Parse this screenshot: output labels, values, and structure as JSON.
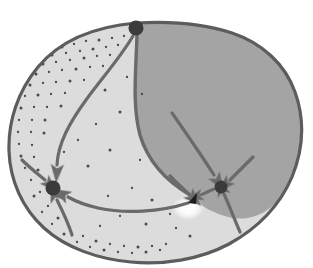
{
  "figure": {
    "title": "Phase portrait on a closed surface region",
    "type": "hand-drawn-diagram",
    "background_color": "#ffffff",
    "width": 313,
    "height": 268
  },
  "palette": {
    "outline": "#5c5c5c",
    "outline_dark": "#4a4a4a",
    "light_region_fill": "#dcdcdc",
    "dark_region_fill": "#a4a4a4",
    "trajectory_stroke": "#6a6a6a",
    "node_fill": "#3a3a3a",
    "stipple_dot": "#4a4a4a",
    "highlight_white": "#ffffff",
    "wedge_fill": "#1e1e1e"
  },
  "outer_boundary": {
    "name": "closed-curve-boundary",
    "stroke_width": 3.2,
    "path": "M 136 23 C 170 21 205 24 232 33 C 262 43 285 64 295 92 C 305 120 303 150 292 177 C 280 205 258 228 229 244 C 199 260 163 265 131 262 C 98 259 66 248 44 228 C 22 208 10 180 9 151 C 8 121 18 91 38 67 C 58 43 90 27 136 23 Z"
  },
  "regions": [
    {
      "name": "light-basin-left",
      "label": "light region",
      "fill": "#dcdcdc",
      "has_stipple": true,
      "stipple_description": "dotted texture along inner boundary"
    },
    {
      "name": "dark-basin-right",
      "label": "dark shaded region",
      "fill": "#a4a4a4",
      "has_stipple": false
    }
  ],
  "separatrix": {
    "name": "separatrix-curve",
    "from_node": "top-node",
    "to_node": "saddle-wedge",
    "stroke_width": 3.4,
    "path": "M 137 35 C 136 70 132 105 140 135 C 148 162 168 182 190 195"
  },
  "nodes": [
    {
      "id": "top-node",
      "name": "node-top",
      "cx": 136,
      "cy": 28,
      "r": 7.5,
      "fill": "#3a3a3a",
      "kind": "source"
    },
    {
      "id": "left-node",
      "name": "node-left-sink",
      "cx": 53,
      "cy": 188,
      "r": 7.5,
      "fill": "#3a3a3a",
      "kind": "sink"
    },
    {
      "id": "right-node",
      "name": "node-right-sink",
      "cx": 221,
      "cy": 187,
      "r": 6.5,
      "fill": "#3a3a3a",
      "kind": "sink"
    }
  ],
  "saddle": {
    "name": "saddle-wedge-marker",
    "cx": 193,
    "cy": 198,
    "description": "dark wedge / arrowhead marker with specular highlight below-left"
  },
  "highlight": {
    "name": "specular-highlight",
    "cx": 188,
    "cy": 208,
    "rx": 16,
    "ry": 12,
    "color": "#ffffff"
  },
  "trajectories": [
    {
      "id": "t1",
      "name": "trajectory-top-to-left",
      "from": "top-node",
      "to": "left-node",
      "stroke_width": 3.2,
      "path": "M 133 36 C 120 58 102 78 86 100 C 70 122 58 143 57 165",
      "arrowhead": {
        "x": 57,
        "y": 170,
        "angle": 94,
        "size": 13
      }
    },
    {
      "id": "t2",
      "name": "trajectory-boundary-to-left-upper",
      "from": "outer-boundary-upper-left",
      "to": "left-node",
      "stroke_width": 3.2,
      "path": "M 22 160 C 30 168 38 174 45 180",
      "arrowhead": {
        "x": 48,
        "y": 183,
        "angle": 45,
        "size": 12
      }
    },
    {
      "id": "t3",
      "name": "trajectory-bottom-curve-to-left",
      "from": "saddle-wedge",
      "to": "left-node",
      "stroke_width": 3.2,
      "path": "M 188 203 C 160 212 125 214 98 208 C 85 205 75 201 68 197",
      "arrowhead": {
        "x": 64,
        "y": 195,
        "angle": 208,
        "size": 13
      }
    },
    {
      "id": "t4",
      "name": "trajectory-lower-boundary-to-left",
      "from": "outer-boundary-lower-left",
      "to": "left-node",
      "stroke_width": 3.2,
      "path": "M 72 235 C 68 222 62 210 57 200",
      "arrowhead": {
        "x": 55,
        "y": 196,
        "angle": 250,
        "size": 13
      }
    },
    {
      "id": "t5",
      "name": "trajectory-upper-to-right-node",
      "from": "dark-region-upper",
      "to": "right-node",
      "stroke_width": 3.2,
      "path": "M 172 113 C 186 133 200 153 214 175",
      "arrowhead": {
        "x": 217,
        "y": 180,
        "angle": 57,
        "size": 13
      }
    },
    {
      "id": "t6",
      "name": "trajectory-right-edge-to-right-node",
      "from": "dark-region-right-edge",
      "to": "right-node",
      "stroke_width": 3.2,
      "path": "M 253 157 C 245 165 238 172 230 180",
      "arrowhead": {
        "x": 227,
        "y": 183,
        "angle": 136,
        "size": 12
      }
    },
    {
      "id": "t7",
      "name": "trajectory-lower-right-to-right-node",
      "from": "dark-region-lower-right",
      "to": "right-node",
      "stroke_width": 3.2,
      "path": "M 240 232 C 234 218 229 205 224 194",
      "arrowhead": {
        "x": 222,
        "y": 190,
        "angle": 248,
        "size": 13
      }
    },
    {
      "id": "t8",
      "name": "trajectory-right-node-to-saddle",
      "from": "right-node",
      "to": "saddle-wedge",
      "stroke_width": 3.0,
      "path": "M 214 189 C 209 191 205 193 201 195",
      "arrowhead": {
        "x": 198,
        "y": 196,
        "angle": 163,
        "size": 11
      }
    },
    {
      "id": "t9",
      "name": "trajectory-separatrix-arrow-to-saddle",
      "from": "separatrix",
      "to": "saddle-wedge",
      "stroke_width": 3.2,
      "path": "M 170 176 C 177 183 183 189 189 194",
      "arrowhead": {
        "x": 192,
        "y": 197,
        "angle": 44,
        "size": 13
      }
    }
  ],
  "stipple_dots": [
    [
      62,
      47
    ],
    [
      74,
      44
    ],
    [
      86,
      41
    ],
    [
      99,
      40
    ],
    [
      112,
      38
    ],
    [
      124,
      36
    ],
    [
      52,
      55
    ],
    [
      66,
      53
    ],
    [
      80,
      51
    ],
    [
      93,
      49
    ],
    [
      106,
      47
    ],
    [
      118,
      45
    ],
    [
      43,
      64
    ],
    [
      56,
      62
    ],
    [
      70,
      60
    ],
    [
      84,
      58
    ],
    [
      97,
      56
    ],
    [
      110,
      55
    ],
    [
      36,
      74
    ],
    [
      49,
      72
    ],
    [
      62,
      70
    ],
    [
      76,
      69
    ],
    [
      90,
      67
    ],
    [
      103,
      66
    ],
    [
      30,
      85
    ],
    [
      43,
      83
    ],
    [
      56,
      82
    ],
    [
      70,
      81
    ],
    [
      84,
      80
    ],
    [
      25,
      96
    ],
    [
      38,
      95
    ],
    [
      51,
      94
    ],
    [
      65,
      93
    ],
    [
      21,
      108
    ],
    [
      34,
      107
    ],
    [
      47,
      107
    ],
    [
      61,
      106
    ],
    [
      19,
      120
    ],
    [
      32,
      120
    ],
    [
      45,
      120
    ],
    [
      18,
      132
    ],
    [
      31,
      132
    ],
    [
      44,
      133
    ],
    [
      19,
      144
    ],
    [
      32,
      145
    ],
    [
      21,
      156
    ],
    [
      34,
      157
    ],
    [
      25,
      168
    ],
    [
      38,
      170
    ],
    [
      31,
      180
    ],
    [
      40,
      192
    ],
    [
      34,
      196
    ],
    [
      48,
      206
    ],
    [
      42,
      212
    ],
    [
      58,
      218
    ],
    [
      52,
      224
    ],
    [
      70,
      228
    ],
    [
      64,
      234
    ],
    [
      83,
      236
    ],
    [
      77,
      242
    ],
    [
      96,
      241
    ],
    [
      90,
      247
    ],
    [
      110,
      244
    ],
    [
      104,
      250
    ],
    [
      124,
      246
    ],
    [
      118,
      252
    ],
    [
      138,
      247
    ],
    [
      132,
      253
    ],
    [
      152,
      246
    ],
    [
      146,
      252
    ],
    [
      166,
      244
    ],
    [
      160,
      250
    ],
    [
      105,
      90
    ],
    [
      127,
      77
    ],
    [
      142,
      94
    ],
    [
      120,
      112
    ],
    [
      96,
      124
    ],
    [
      78,
      140
    ],
    [
      110,
      150
    ],
    [
      140,
      160
    ],
    [
      64,
      152
    ],
    [
      88,
      166
    ],
    [
      132,
      188
    ],
    [
      108,
      196
    ],
    [
      152,
      200
    ],
    [
      170,
      214
    ],
    [
      120,
      216
    ],
    [
      146,
      224
    ],
    [
      176,
      228
    ],
    [
      100,
      226
    ],
    [
      190,
      236
    ]
  ]
}
